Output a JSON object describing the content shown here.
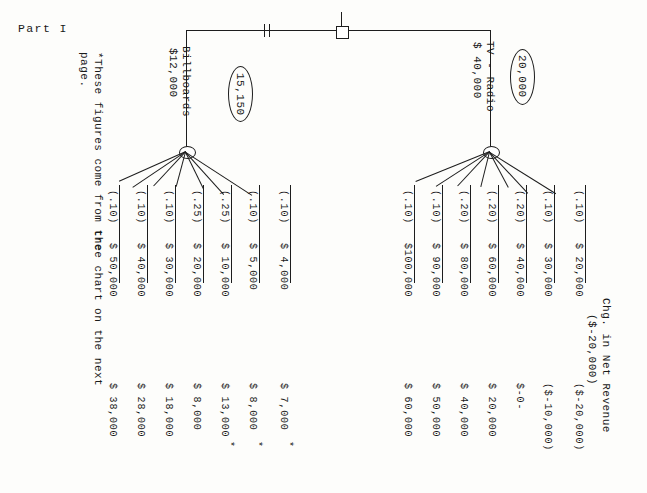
{
  "document": {
    "part_label": "Part I",
    "footnote": "*These figures come from the tree chart on the next page.",
    "column_header_line1": "Chg. in Net Revenue",
    "column_header_line2": "($-20,000)"
  },
  "tree": {
    "decision_node": "decision-square",
    "pruned_mark": "||",
    "branches": [
      {
        "id": "billboards",
        "label": "Billboards",
        "cost": "$12,000",
        "ev_oval": "15,150",
        "pruned": true,
        "outcomes": [
          {
            "prob": "(.10)",
            "payoff": "$ 50,000",
            "net": "$ 38,000",
            "starred": false
          },
          {
            "prob": "(.10)",
            "payoff": "$ 40,000",
            "net": "$ 28,000",
            "starred": false
          },
          {
            "prob": "(.10)",
            "payoff": "$ 30,000",
            "net": "$ 18,000",
            "starred": false
          },
          {
            "prob": "(.25)",
            "payoff": "$ 20,000",
            "net": "$  8,000",
            "starred": false
          },
          {
            "prob": "(.25)",
            "payoff": "$ 10,000",
            "net": "$ 13,000",
            "starred": true
          },
          {
            "prob": "(.10)",
            "payoff": "$  5,000",
            "net": "$  8,000",
            "starred": true
          },
          {
            "prob": "(.10)",
            "payoff": "$  4,000",
            "net": "$  7,000",
            "starred": true
          }
        ]
      },
      {
        "id": "tv-radio",
        "label": "TV - Radio",
        "cost": "$ 40,000",
        "ev_oval": "20,000",
        "pruned": false,
        "outcomes": [
          {
            "prob": "(.10)",
            "payoff": "$100,000",
            "net": "$ 60,000",
            "starred": false
          },
          {
            "prob": "(.10)",
            "payoff": "$ 90,000",
            "net": "$ 50,000",
            "starred": false
          },
          {
            "prob": "(.20)",
            "payoff": "$ 80,000",
            "net": "$ 40,000",
            "starred": false
          },
          {
            "prob": "(.20)",
            "payoff": "$ 60,000",
            "net": "$ 20,000",
            "starred": false
          },
          {
            "prob": "(.20)",
            "payoff": "$ 40,000",
            "net": "$-0-",
            "starred": false
          },
          {
            "prob": "(.10)",
            "payoff": "$ 30,000",
            "net": "($-10,000)",
            "starred": false
          },
          {
            "prob": "(.10)",
            "payoff": "$ 20,000",
            "net": "($-20,000)",
            "starred": false
          }
        ]
      }
    ]
  }
}
